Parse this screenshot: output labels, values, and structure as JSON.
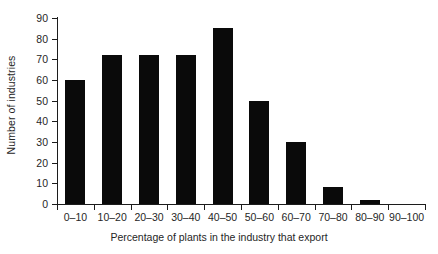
{
  "chart_data": {
    "type": "bar",
    "title": "",
    "xlabel": "Percentage of plants in the industry that export",
    "ylabel": "Number of industries",
    "categories": [
      "0–10",
      "10–20",
      "20–30",
      "30–40",
      "40–50",
      "50–60",
      "60–70",
      "70–80",
      "80–90",
      "90–100"
    ],
    "values": [
      60,
      72,
      72,
      72,
      85,
      50,
      30,
      8,
      2,
      0
    ],
    "ylim": [
      0,
      90
    ],
    "ytick_labels": [
      "0",
      "10",
      "20",
      "30",
      "40",
      "50",
      "60",
      "70",
      "80",
      "90"
    ],
    "ytick_values": [
      0,
      10,
      20,
      30,
      40,
      50,
      60,
      70,
      80,
      90
    ],
    "grid": false,
    "legend": null,
    "bar_color": "#0a0a0a",
    "axis_color": "#1c1c1c",
    "background": "#ffffff"
  }
}
